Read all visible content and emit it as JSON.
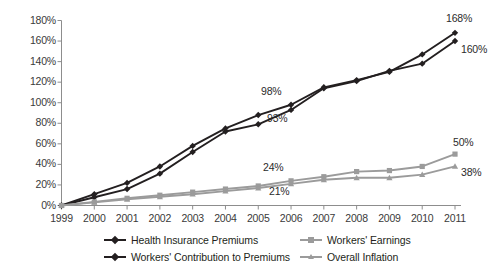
{
  "chart_data": {
    "type": "line",
    "title": "",
    "subtitle": "",
    "xlabel": "",
    "ylabel": "",
    "x": [
      1999,
      2000,
      2001,
      2002,
      2003,
      2004,
      2005,
      2006,
      2007,
      2008,
      2009,
      2010,
      2011
    ],
    "xtick_labels": [
      "1999",
      "2000",
      "2001",
      "2002",
      "2003",
      "2004",
      "2005",
      "2006",
      "2007",
      "2008",
      "2009",
      "2010",
      "2011"
    ],
    "ytick_labels": [
      "0%",
      "20%",
      "40%",
      "60%",
      "80%",
      "100%",
      "120%",
      "140%",
      "160%",
      "180%"
    ],
    "ytick_values": [
      0,
      20,
      40,
      60,
      80,
      100,
      120,
      140,
      160,
      180
    ],
    "ylim": [
      0,
      180
    ],
    "grid": false,
    "legend_position": "bottom",
    "series": [
      {
        "name": "Health Insurance Premiums",
        "color": "#231f20",
        "marker": "diamond",
        "values": [
          0,
          8,
          16,
          31,
          52,
          72,
          79,
          93,
          114,
          121,
          131,
          138,
          160
        ]
      },
      {
        "name": "Workers' Contribution to Premiums",
        "color": "#231f20",
        "marker": "diamond",
        "values": [
          0,
          11,
          22,
          38,
          58,
          75,
          88,
          98,
          115,
          122,
          130,
          147,
          168
        ]
      },
      {
        "name": "Workers' Earnings",
        "color": "#9b9b9b",
        "marker": "square",
        "values": [
          0,
          3.5,
          7,
          10,
          13,
          16,
          19,
          24,
          28,
          33,
          34,
          38,
          50
        ]
      },
      {
        "name": "Overall Inflation",
        "color": "#9b9b9b",
        "marker": "triangle",
        "values": [
          0,
          3,
          6,
          8.5,
          11,
          14,
          17,
          21,
          25,
          27,
          27,
          30,
          38
        ]
      }
    ],
    "annotations": [
      {
        "text": "168%",
        "series": "Workers' Contribution to Premiums",
        "year": 2011,
        "value": 168
      },
      {
        "text": "160%",
        "series": "Health Insurance Premiums",
        "year": 2011,
        "value": 160
      },
      {
        "text": "98%",
        "series": "Workers' Contribution to Premiums",
        "year": 2006,
        "value": 98
      },
      {
        "text": "93%",
        "series": "Health Insurance Premiums",
        "year": 2006,
        "value": 93
      },
      {
        "text": "50%",
        "series": "Workers' Earnings",
        "year": 2011,
        "value": 50
      },
      {
        "text": "38%",
        "series": "Overall Inflation",
        "year": 2011,
        "value": 38
      },
      {
        "text": "24%",
        "series": "Workers' Earnings",
        "year": 2006,
        "value": 24
      },
      {
        "text": "21%",
        "series": "Overall Inflation",
        "year": 2006,
        "value": 21
      }
    ]
  },
  "legend": {
    "entries": [
      {
        "label": "Health Insurance Premiums",
        "color": "#231f20",
        "marker": "diamond"
      },
      {
        "label": "Workers' Earnings",
        "color": "#9b9b9b",
        "marker": "square"
      },
      {
        "label": "Workers' Contribution to Premiums",
        "color": "#231f20",
        "marker": "diamond"
      },
      {
        "label": "Overall Inflation",
        "color": "#9b9b9b",
        "marker": "triangle"
      }
    ]
  }
}
